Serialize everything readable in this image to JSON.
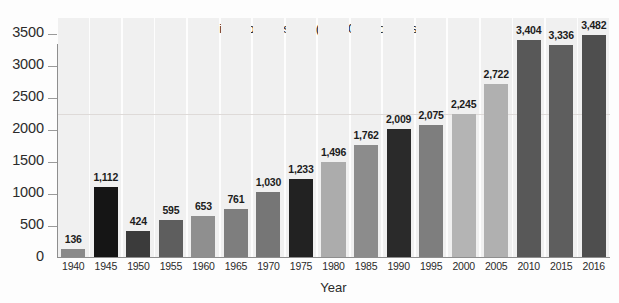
{
  "chart_data": {
    "type": "bar",
    "title": "Billions of constant (FY 2009) dollars",
    "xlabel": "Year",
    "ylabel": "",
    "ylim": [
      0,
      3750
    ],
    "grid": false,
    "legend": null,
    "categories": [
      "1940",
      "1945",
      "1950",
      "1955",
      "1960",
      "1965",
      "1970",
      "1975",
      "1980",
      "1985",
      "1990",
      "1995",
      "2000",
      "2005",
      "2010",
      "2015",
      "2016"
    ],
    "values": [
      136,
      1112,
      424,
      595,
      653,
      761,
      1030,
      1233,
      1496,
      1762,
      2009,
      2075,
      2245,
      2722,
      3404,
      3336,
      3482
    ],
    "value_labels": [
      "136",
      "1,112",
      "424",
      "595",
      "653",
      "761",
      "1,030",
      "1,233",
      "1,496",
      "1,762",
      "2,009",
      "2,075",
      "2,245",
      "2,722",
      "3,404",
      "3,336",
      "3,482"
    ],
    "bar_colors": [
      "#8a8a8a",
      "#151515",
      "#3b3b3b",
      "#5e5e5e",
      "#8f8f8f",
      "#7e7e7e",
      "#767676",
      "#222222",
      "#acacac",
      "#8c8c8c",
      "#2a2a2a",
      "#7e7e7e",
      "#b4b4b4",
      "#b0b0b0",
      "#585858",
      "#5e5e5e",
      "#4e4e4e"
    ],
    "y_ticks": [
      0,
      500,
      1000,
      1500,
      2000,
      2500,
      3000,
      3500
    ],
    "y_tick_labels": [
      "0",
      "500",
      "1000",
      "1500",
      "2000",
      "2500",
      "3000",
      "3500"
    ],
    "faint_gridline_value": 2250,
    "axis_color": "#8e8e8e",
    "band_color": "#f0f0f0",
    "background_color": "#fdfdfd",
    "text_color": "#2b2b2b"
  }
}
